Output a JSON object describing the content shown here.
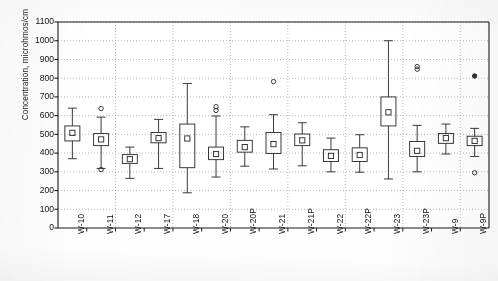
{
  "chart_data": {
    "type": "box",
    "title": "",
    "xlabel": "",
    "ylabel": "Concentration, microhmos/cm",
    "ylim": [
      0,
      1100
    ],
    "ytick_step": 100,
    "yticks": [
      0,
      100,
      200,
      300,
      400,
      500,
      600,
      700,
      800,
      900,
      1000,
      1100
    ],
    "grid": true,
    "grid_style": "dotted",
    "legend": "none",
    "categories": [
      "W-10",
      "W-11",
      "W-12",
      "W-17",
      "W-18",
      "W-20",
      "W-20P",
      "W-21",
      "W-21P",
      "W-22",
      "W-22P",
      "W-23",
      "W-23P",
      "W-9",
      "W-9P"
    ],
    "boxes": [
      {
        "category": "W-10",
        "min": 370,
        "q1": 465,
        "median": 508,
        "q3": 545,
        "max": 640,
        "outliers": []
      },
      {
        "category": "W-11",
        "min": 318,
        "q1": 440,
        "median": 473,
        "q3": 505,
        "max": 592,
        "outliers": [
          638,
          312
        ]
      },
      {
        "category": "W-12",
        "min": 265,
        "q1": 345,
        "median": 368,
        "q3": 392,
        "max": 432,
        "outliers": []
      },
      {
        "category": "W-17",
        "min": 318,
        "q1": 455,
        "median": 480,
        "q3": 510,
        "max": 580,
        "outliers": []
      },
      {
        "category": "W-18",
        "min": 188,
        "q1": 322,
        "median": 478,
        "q3": 555,
        "max": 772,
        "outliers": []
      },
      {
        "category": "W-20",
        "min": 272,
        "q1": 365,
        "median": 395,
        "q3": 432,
        "max": 598,
        "outliers": [
          648,
          628
        ]
      },
      {
        "category": "W-20P",
        "min": 330,
        "q1": 405,
        "median": 432,
        "q3": 468,
        "max": 540,
        "outliers": []
      },
      {
        "category": "W-21",
        "min": 315,
        "q1": 398,
        "median": 448,
        "q3": 510,
        "max": 605,
        "outliers": [
          782
        ]
      },
      {
        "category": "W-21P",
        "min": 332,
        "q1": 440,
        "median": 468,
        "q3": 502,
        "max": 562,
        "outliers": []
      },
      {
        "category": "W-22",
        "min": 300,
        "q1": 355,
        "median": 385,
        "q3": 418,
        "max": 480,
        "outliers": []
      },
      {
        "category": "W-22P",
        "min": 298,
        "q1": 355,
        "median": 390,
        "q3": 428,
        "max": 498,
        "outliers": []
      },
      {
        "category": "W-23",
        "min": 262,
        "q1": 545,
        "median": 618,
        "q3": 700,
        "max": 1000,
        "outliers": []
      },
      {
        "category": "W-23P",
        "min": 300,
        "q1": 382,
        "median": 412,
        "q3": 462,
        "max": 548,
        "outliers": [
          862,
          848
        ]
      },
      {
        "category": "W-9",
        "min": 395,
        "q1": 452,
        "median": 480,
        "q3": 505,
        "max": 555,
        "outliers": []
      },
      {
        "category": "W-9P",
        "min": 382,
        "q1": 440,
        "median": 465,
        "q3": 490,
        "max": 532,
        "outliers": [
          812,
          295
        ]
      }
    ],
    "marker_notes": {
      "median_marker": "open-square",
      "outlier_marker": "open-circle",
      "filled_outlier_categories": [
        "W-9P"
      ]
    },
    "colors": {
      "axis": "#1a1a1a",
      "box_line": "#303030",
      "grid": "#9a9a9a",
      "background": "#fdfdfd"
    }
  }
}
